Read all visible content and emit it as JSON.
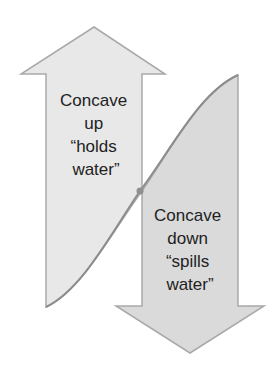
{
  "diagram": {
    "up_label": {
      "lines": [
        "Concave",
        "up",
        "“holds",
        "water”"
      ]
    },
    "down_label": {
      "lines": [
        "Concave",
        "down",
        "“spills",
        "water”"
      ]
    },
    "colors": {
      "up_fill": "#e8e8e8",
      "down_fill": "#dadada",
      "outline": "#a9a9a9",
      "curve": "#8c8c8c",
      "text": "#222222"
    }
  }
}
